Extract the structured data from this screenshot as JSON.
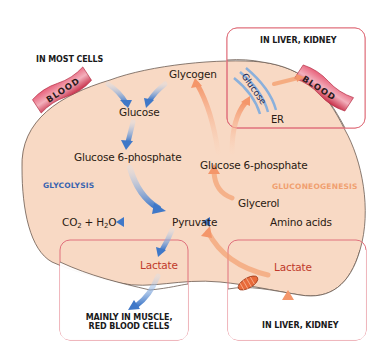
{
  "diagram": {
    "type": "metabolic-pathway",
    "colors": {
      "cell_fill": "#f8d9c4",
      "cell_border": "#6b5a50",
      "box_border": "#e0707c",
      "glycolysis_arrow": "#3f78c8",
      "gluconeogenesis_arrow": "#f4a070",
      "blood_vessel": "#d9405a",
      "er_membrane": "#8ab0dc",
      "mitochondrion": "#e86a3a"
    },
    "region_labels": {
      "top_left": "IN MOST CELLS",
      "top_right": "IN LIVER, KIDNEY",
      "bottom_left_line1": "MAINLY IN MUSCLE,",
      "bottom_left_line2": "RED BLOOD CELLS",
      "bottom_right": "IN LIVER, KIDNEY"
    },
    "pathways": {
      "glycolysis": "GLYCOLYSIS",
      "gluconeogenesis": "GLUCONEOGENESIS"
    },
    "blood_left": "BLOOD",
    "blood_right": "BLOOD",
    "er_label": "ER",
    "er_glucose": "Glucose",
    "metabolites": {
      "glycogen": "Glycogen",
      "glucose": "Glucose",
      "g6p_left": "Glucose 6-phosphate",
      "g6p_right": "Glucose 6-phosphate",
      "co2": "CO",
      "co2_sub": "2",
      "plus": " + H",
      "h2o_sub": "2",
      "o": "O",
      "pyruvate": "Pyruvate",
      "glycerol": "Glycerol",
      "amino_acids": "Amino acids",
      "lactate_left": "Lactate",
      "lactate_right": "Lactate"
    }
  }
}
